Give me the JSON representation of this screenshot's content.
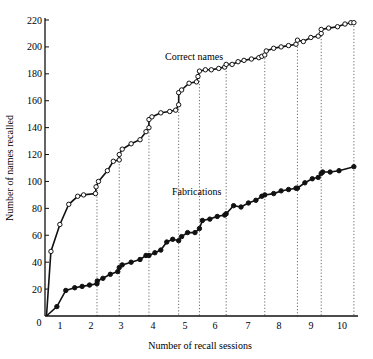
{
  "chart_data": {
    "type": "line",
    "title": "",
    "xlabel": "Number of recall sessions",
    "ylabel": "Number of names recalled",
    "xlim": [
      0,
      10.5
    ],
    "ylim": [
      0,
      220
    ],
    "x_ticks": [
      "0",
      "1",
      "2",
      "3",
      "4",
      "5",
      "6",
      "7",
      "8",
      "9",
      "10"
    ],
    "y_ticks": [
      "20",
      "40",
      "60",
      "80",
      "100",
      "120",
      "140",
      "160",
      "180",
      "200",
      "220"
    ],
    "session_boundaries": [
      1.75,
      2.5,
      3.5,
      4.5,
      5.2,
      6.1,
      7.4,
      8.5,
      9.3,
      10.4
    ],
    "grid": false,
    "legend": "inline annotations",
    "series": [
      {
        "name": "Correct names",
        "marker": "open-circle",
        "points": [
          [
            0.05,
            0
          ],
          [
            0.2,
            48
          ],
          [
            0.5,
            68
          ],
          [
            0.8,
            83
          ],
          [
            1.1,
            89
          ],
          [
            1.3,
            90
          ],
          [
            1.7,
            91
          ],
          [
            1.72,
            96
          ],
          [
            1.8,
            100
          ],
          [
            2.1,
            108
          ],
          [
            2.3,
            115
          ],
          [
            2.5,
            116
          ],
          [
            2.5,
            120
          ],
          [
            2.6,
            124
          ],
          [
            2.9,
            128
          ],
          [
            3.2,
            131
          ],
          [
            3.4,
            137
          ],
          [
            3.5,
            140
          ],
          [
            3.5,
            146
          ],
          [
            3.6,
            148
          ],
          [
            3.9,
            151
          ],
          [
            4.2,
            152
          ],
          [
            4.4,
            153
          ],
          [
            4.5,
            157
          ],
          [
            4.5,
            166
          ],
          [
            4.6,
            168
          ],
          [
            4.85,
            173
          ],
          [
            5.1,
            174
          ],
          [
            5.15,
            178
          ],
          [
            5.2,
            182
          ],
          [
            5.4,
            183
          ],
          [
            5.6,
            183
          ],
          [
            5.85,
            184
          ],
          [
            6.05,
            185
          ],
          [
            6.1,
            187
          ],
          [
            6.3,
            187
          ],
          [
            6.5,
            189
          ],
          [
            6.7,
            190
          ],
          [
            6.95,
            191
          ],
          [
            7.2,
            192
          ],
          [
            7.3,
            193
          ],
          [
            7.4,
            194
          ],
          [
            7.45,
            197
          ],
          [
            7.7,
            199
          ],
          [
            7.95,
            200
          ],
          [
            8.2,
            201
          ],
          [
            8.45,
            202
          ],
          [
            8.5,
            205
          ],
          [
            8.7,
            204
          ],
          [
            8.95,
            207
          ],
          [
            9.2,
            208
          ],
          [
            9.3,
            210
          ],
          [
            9.3,
            213
          ],
          [
            9.55,
            214
          ],
          [
            9.85,
            215
          ],
          [
            10.1,
            217
          ],
          [
            10.3,
            218
          ],
          [
            10.4,
            218
          ]
        ]
      },
      {
        "name": "Fabrications",
        "marker": "filled-circle",
        "points": [
          [
            0.05,
            0
          ],
          [
            0.4,
            7
          ],
          [
            0.7,
            19
          ],
          [
            1.0,
            21
          ],
          [
            1.25,
            22
          ],
          [
            1.5,
            23
          ],
          [
            1.75,
            24
          ],
          [
            1.76,
            26
          ],
          [
            1.95,
            28
          ],
          [
            2.2,
            31
          ],
          [
            2.45,
            33
          ],
          [
            2.5,
            36
          ],
          [
            2.6,
            38
          ],
          [
            2.9,
            40
          ],
          [
            3.2,
            42
          ],
          [
            3.4,
            45
          ],
          [
            3.5,
            45
          ],
          [
            3.7,
            47
          ],
          [
            3.9,
            49
          ],
          [
            4.1,
            55
          ],
          [
            4.3,
            57
          ],
          [
            4.5,
            56
          ],
          [
            4.6,
            59
          ],
          [
            4.8,
            62
          ],
          [
            5.05,
            62
          ],
          [
            5.2,
            65
          ],
          [
            5.3,
            71
          ],
          [
            5.55,
            72
          ],
          [
            5.8,
            74
          ],
          [
            6.05,
            75
          ],
          [
            6.1,
            76
          ],
          [
            6.35,
            82
          ],
          [
            6.6,
            81
          ],
          [
            6.85,
            84
          ],
          [
            7.1,
            86
          ],
          [
            7.3,
            89
          ],
          [
            7.4,
            90
          ],
          [
            7.7,
            91
          ],
          [
            7.95,
            93
          ],
          [
            8.2,
            94
          ],
          [
            8.45,
            95
          ],
          [
            8.5,
            95
          ],
          [
            8.75,
            99
          ],
          [
            9.0,
            102
          ],
          [
            9.2,
            103
          ],
          [
            9.3,
            106
          ],
          [
            9.35,
            107
          ],
          [
            9.6,
            107
          ],
          [
            9.9,
            108
          ],
          [
            10.4,
            111
          ]
        ]
      }
    ],
    "annotations": [
      {
        "text": "Correct names",
        "x": 4.4,
        "y": 190
      },
      {
        "text": "Fabrications",
        "x": 5.0,
        "y": 92
      }
    ]
  },
  "labels": {
    "xlabel": "Number of recall sessions",
    "ylabel": "Number of names recalled",
    "correct": "Correct names",
    "fabrications": "Fabrications",
    "origin": "0"
  }
}
